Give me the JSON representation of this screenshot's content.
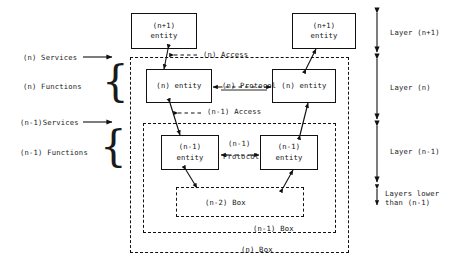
{
  "diagram": {
    "entities": [
      {
        "id": "np1-left",
        "line1": "(n+1)",
        "line2": "entity"
      },
      {
        "id": "np1-right",
        "line1": "(n+1)",
        "line2": "entity"
      },
      {
        "id": "n-left",
        "line1": "(n) entity",
        "line2": ""
      },
      {
        "id": "n-right",
        "line1": "(n) entity",
        "line2": ""
      },
      {
        "id": "nm1-left",
        "line1": "(n-1)",
        "line2": "entity"
      },
      {
        "id": "nm1-right",
        "line1": "(n-1)",
        "line2": "entity"
      }
    ],
    "left_labels": [
      {
        "id": "n-services",
        "text": "(n) Services"
      },
      {
        "id": "n-functions",
        "text": "(n) Functions"
      },
      {
        "id": "nm1-services",
        "text": "(n-1)Services"
      },
      {
        "id": "nm1-functions",
        "text": "(n-1) Functions"
      }
    ],
    "right_labels": [
      {
        "id": "layer-np1",
        "text": "Layer (n+1)"
      },
      {
        "id": "layer-n",
        "text": "Layer (n)"
      },
      {
        "id": "layer-nm1",
        "text": "Layer (n-1)"
      },
      {
        "id": "layers-lower-l1",
        "text": "Layers lower"
      },
      {
        "id": "layers-lower-l2",
        "text": "than (n-1)"
      }
    ],
    "connector_labels": [
      {
        "id": "n-access",
        "text": "(n) Access"
      },
      {
        "id": "n-protocol",
        "text": "(n) Protocol"
      },
      {
        "id": "nm1-access",
        "text": "(n-1) Access"
      },
      {
        "id": "nm1-protocol-l1",
        "text": "(n-1)"
      },
      {
        "id": "nm1-protocol-l2",
        "text": "Protocol"
      }
    ],
    "box_labels": [
      {
        "id": "n-minus-2-box",
        "text": "(n-2) Box"
      },
      {
        "id": "n-minus-1-box",
        "text": "(n-1) Box"
      },
      {
        "id": "n-box",
        "text": "(n) Box"
      }
    ],
    "colors": {
      "line": "#111111",
      "text": "#1a1a1a",
      "background": "#ffffff"
    }
  }
}
